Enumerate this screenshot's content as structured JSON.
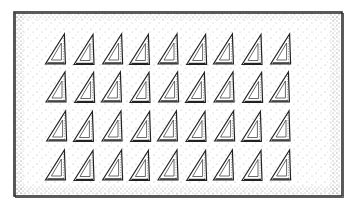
{
  "illustration": {
    "subject": "grid of triangle rulers (set squares)",
    "style": "hand-drawn stippled sketch",
    "rows": 4,
    "columns": 9,
    "total_items": 36,
    "item_icon": "triangle-ruler-icon",
    "colors": {
      "background": "#ffffff",
      "ink": "#222222",
      "stipple": "#555555"
    }
  }
}
